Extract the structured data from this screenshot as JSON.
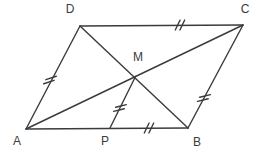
{
  "figure": {
    "width": 260,
    "height": 154,
    "background_color": "#ffffff",
    "stroke_color": "#3b3b3b",
    "stroke_width": 1.4,
    "label_color": "#3b3b3b",
    "label_font_size": 12,
    "tick_len": 11,
    "tick_gap": 4.6,
    "points": {
      "A": {
        "x": 26,
        "y": 129
      },
      "B": {
        "x": 188,
        "y": 128
      },
      "C": {
        "x": 243,
        "y": 25
      },
      "D": {
        "x": 80,
        "y": 26
      },
      "M": {
        "x": 135.5,
        "y": 76.5
      },
      "P": {
        "x": 110,
        "y": 128
      }
    },
    "segments": [
      {
        "name": "side-AB",
        "from": "A",
        "to": "B"
      },
      {
        "name": "side-BC",
        "from": "B",
        "to": "C"
      },
      {
        "name": "side-CD",
        "from": "C",
        "to": "D"
      },
      {
        "name": "side-DA",
        "from": "D",
        "to": "A"
      },
      {
        "name": "diagonal-AC",
        "from": "A",
        "to": "C"
      },
      {
        "name": "diagonal-DB",
        "from": "D",
        "to": "B"
      },
      {
        "name": "segment-MP",
        "from": "M",
        "to": "P"
      }
    ],
    "tick_marks": [
      {
        "name": "double-tick-side-DA",
        "x": 50,
        "y": 80,
        "stroke_angle": -18,
        "offset_angle": -62
      },
      {
        "name": "double-tick-side-DC",
        "x": 180,
        "y": 25,
        "stroke_angle": -64,
        "offset_angle": 0
      },
      {
        "name": "double-tick-side-BC",
        "x": 204,
        "y": 98,
        "stroke_angle": -14,
        "offset_angle": -62
      },
      {
        "name": "double-tick-segment-MP",
        "x": 120,
        "y": 108,
        "stroke_angle": -14,
        "offset_angle": -64
      },
      {
        "name": "double-tick-segment-PB",
        "x": 149,
        "y": 128,
        "stroke_angle": -64,
        "offset_angle": 0
      }
    ],
    "labels": [
      {
        "text": "A",
        "x": 17,
        "y": 141
      },
      {
        "text": "B",
        "x": 197,
        "y": 142
      },
      {
        "text": "C",
        "x": 245,
        "y": 9
      },
      {
        "text": "D",
        "x": 70,
        "y": 9
      },
      {
        "text": "M",
        "x": 138,
        "y": 57
      },
      {
        "text": "P",
        "x": 105,
        "y": 141
      }
    ]
  }
}
